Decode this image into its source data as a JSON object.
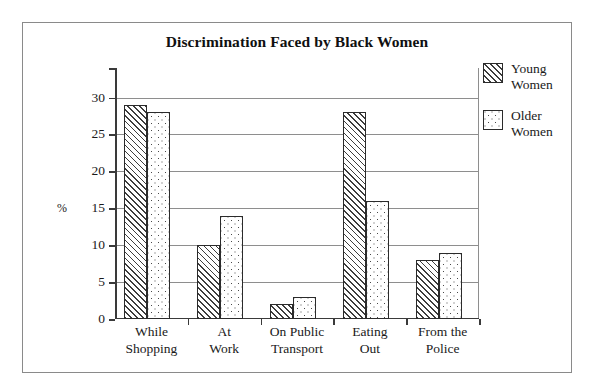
{
  "chart_data": {
    "type": "bar",
    "title": "Discrimination Faced by Black Women",
    "xlabel": "",
    "ylabel": "%",
    "categories": [
      "While Shopping",
      "At Work",
      "On Public Transport",
      "Eating Out",
      "From the Police"
    ],
    "category_lines": [
      [
        "While",
        "Shopping"
      ],
      [
        "At",
        "Work"
      ],
      [
        "On Public",
        "Transport"
      ],
      [
        "Eating",
        "Out"
      ],
      [
        "From the",
        "Police"
      ]
    ],
    "series": [
      {
        "name": "Young Women",
        "name_lines": [
          "Young",
          "Women"
        ],
        "pattern": "diagonal-hatch",
        "values": [
          29,
          10,
          2,
          28,
          8
        ]
      },
      {
        "name": "Older Women",
        "name_lines": [
          "Older",
          "Women"
        ],
        "pattern": "dotted",
        "values": [
          28,
          14,
          3,
          16,
          9
        ]
      }
    ],
    "ylim": [
      0,
      34
    ],
    "yticks": [
      0,
      5,
      10,
      15,
      20,
      25,
      30
    ],
    "ytick_labels": [
      "0",
      "5",
      "10",
      "15",
      "20",
      "25",
      "30"
    ],
    "grid": true,
    "grid_axis": "y",
    "legend_position": "right",
    "colors": {
      "bar_outline": "#2b2b2b",
      "bar_fill": "#ffffff",
      "gridline": "#8e8e8e",
      "axis": "#3a3a3a",
      "frame": "#8a8a8a",
      "text": "#1a1a1a"
    }
  }
}
